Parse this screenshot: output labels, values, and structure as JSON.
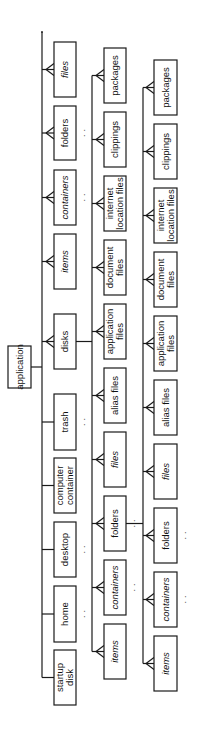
{
  "diagram": {
    "orientation": "rotated -90deg",
    "colors": {
      "stroke": "#1a1a1a",
      "fill": "#ffffff",
      "text": "#111111"
    },
    "root": {
      "label": "application",
      "box": {
        "x": 8,
        "y": 346,
        "w": 23,
        "h": 42
      },
      "connect_to_x": 42
    },
    "columns": [
      {
        "id": "column-1",
        "line_x": 42,
        "line_y1": 32,
        "line_y2": 678,
        "box_x": 54,
        "box_w": 22,
        "items": [
          {
            "label": "files",
            "italic": true,
            "y": 42,
            "h": 55,
            "link": "many",
            "more": false
          },
          {
            "label": "folders",
            "italic": false,
            "y": 106,
            "h": 54,
            "link": "many",
            "more": true
          },
          {
            "label": "containers",
            "italic": true,
            "y": 170,
            "h": 55,
            "link": "many",
            "more": true
          },
          {
            "label": "items",
            "italic": true,
            "y": 234,
            "h": 55,
            "link": "many",
            "more": false
          },
          {
            "label": "disks",
            "italic": false,
            "y": 314,
            "h": 55,
            "link": "many",
            "more": false,
            "expands_to": "column-2"
          },
          {
            "label": "trash",
            "italic": false,
            "y": 394,
            "h": 56,
            "link": "one",
            "more": true
          },
          {
            "label": "computer container",
            "italic": false,
            "y": 458,
            "h": 55,
            "link": "one",
            "more": false
          },
          {
            "label": "desktop",
            "italic": false,
            "y": 522,
            "h": 55,
            "link": "one",
            "more": true
          },
          {
            "label": "home",
            "italic": false,
            "y": 586,
            "h": 56,
            "link": "one",
            "more": true
          },
          {
            "label": "startup disk",
            "italic": false,
            "y": 650,
            "h": 55,
            "link": "one",
            "more": false
          }
        ]
      },
      {
        "id": "column-2",
        "line_x": 92,
        "line_y1": 70,
        "line_y2": 654,
        "box_x": 104,
        "box_w": 22,
        "items": [
          {
            "label": "packages",
            "italic": false,
            "y": 48,
            "h": 55,
            "link": "many",
            "more": false
          },
          {
            "label": "clippings",
            "italic": false,
            "y": 112,
            "h": 55,
            "link": "many",
            "more": false
          },
          {
            "label": "internet location files",
            "italic": false,
            "y": 176,
            "h": 55,
            "link": "many",
            "more": false
          },
          {
            "label": "document files",
            "italic": false,
            "y": 240,
            "h": 55,
            "link": "many",
            "more": false
          },
          {
            "label": "application files",
            "italic": false,
            "y": 304,
            "h": 55,
            "link": "many",
            "more": false
          },
          {
            "label": "alias files",
            "italic": false,
            "y": 368,
            "h": 55,
            "link": "many",
            "more": false
          },
          {
            "label": "files",
            "italic": true,
            "y": 432,
            "h": 55,
            "link": "many",
            "more": false
          },
          {
            "label": "folders",
            "italic": false,
            "y": 496,
            "h": 55,
            "link": "many",
            "more": true,
            "expands_to": "column-3"
          },
          {
            "label": "containers",
            "italic": true,
            "y": 560,
            "h": 55,
            "link": "many",
            "more": true
          },
          {
            "label": "items",
            "italic": true,
            "y": 624,
            "h": 55,
            "link": "many",
            "more": false
          }
        ]
      },
      {
        "id": "column-3",
        "line_x": 143,
        "line_y1": 83,
        "line_y2": 664,
        "box_x": 154,
        "box_w": 23,
        "items": [
          {
            "label": "packages",
            "italic": false,
            "y": 60,
            "h": 55,
            "link": "many",
            "more": false
          },
          {
            "label": "clippings",
            "italic": false,
            "y": 124,
            "h": 55,
            "link": "many",
            "more": false
          },
          {
            "label": "internet location files",
            "italic": false,
            "y": 188,
            "h": 55,
            "link": "many",
            "more": false
          },
          {
            "label": "document files",
            "italic": false,
            "y": 252,
            "h": 55,
            "link": "many",
            "more": false
          },
          {
            "label": "application files",
            "italic": false,
            "y": 316,
            "h": 55,
            "link": "many",
            "more": false
          },
          {
            "label": "alias files",
            "italic": false,
            "y": 380,
            "h": 55,
            "link": "many",
            "more": false
          },
          {
            "label": "files",
            "italic": true,
            "y": 444,
            "h": 55,
            "link": "many",
            "more": false
          },
          {
            "label": "folders",
            "italic": false,
            "y": 508,
            "h": 55,
            "link": "many",
            "more": true
          },
          {
            "label": "containers",
            "italic": true,
            "y": 572,
            "h": 55,
            "link": "many",
            "more": true
          },
          {
            "label": "items",
            "italic": true,
            "y": 636,
            "h": 55,
            "link": "many",
            "more": false
          }
        ]
      }
    ],
    "more_indicator": "· ·"
  }
}
